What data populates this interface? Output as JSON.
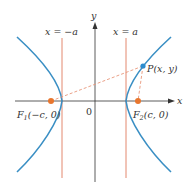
{
  "figure": {
    "labels": {
      "y_axis": "y",
      "x_axis": "x",
      "origin": "0",
      "left_line": "x = −a",
      "right_line": "x = a",
      "point_p": "P(x, y)",
      "focus1_main": "F",
      "focus1_sub": "1",
      "focus1_coords": "(−c, 0)",
      "focus2_main": "F",
      "focus2_sub": "2",
      "focus2_coords": "(c, 0)"
    },
    "colors": {
      "hyperbola": "#3a8fc4",
      "vertical_lines": "#e07a5f",
      "focus_points": "#e8762e",
      "point_p": "#2b8ccf",
      "dashed_segments": "#e8967a",
      "axes": "#333333"
    }
  }
}
